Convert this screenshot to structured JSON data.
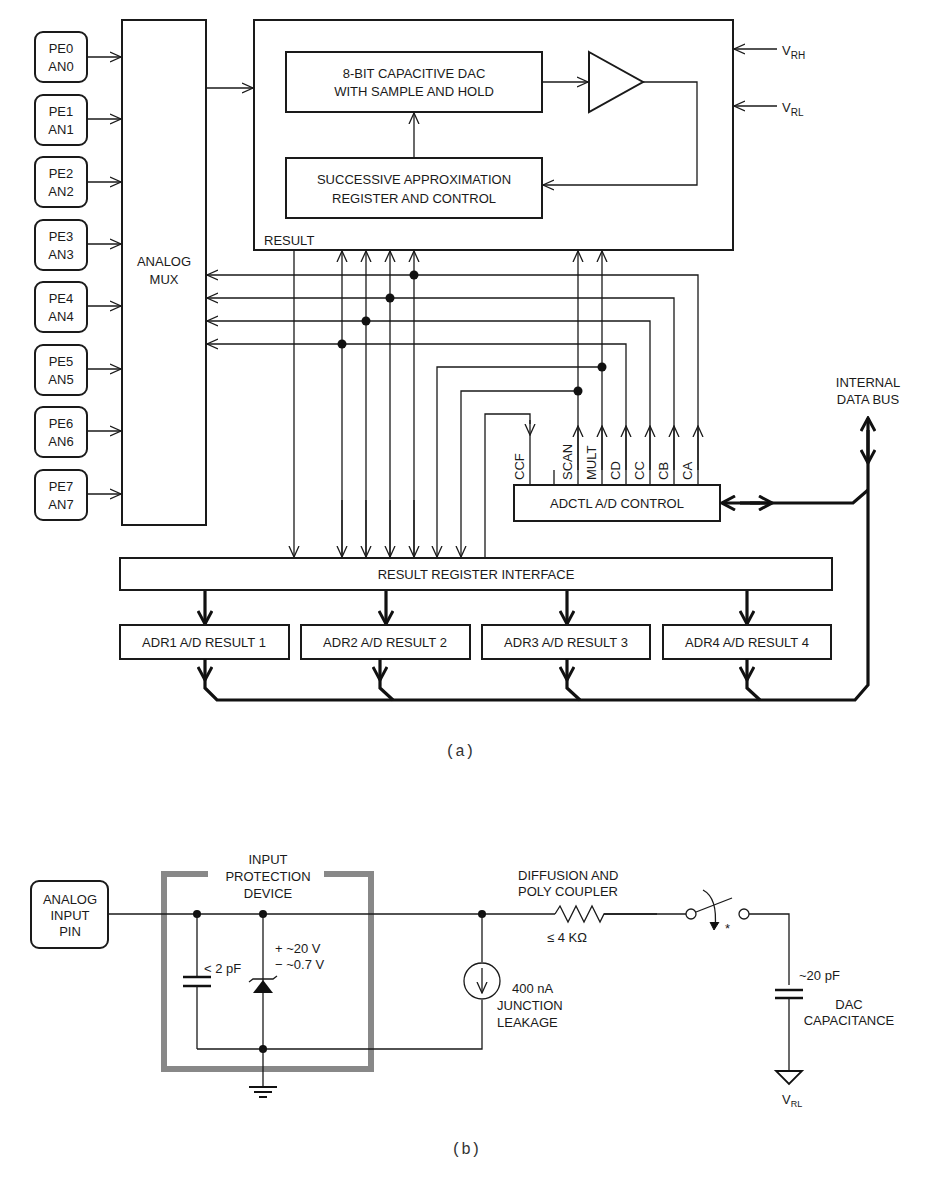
{
  "figure_a": {
    "label": "(a)",
    "pins": [
      {
        "port": "PE0",
        "analog": "AN0"
      },
      {
        "port": "PE1",
        "analog": "AN1"
      },
      {
        "port": "PE2",
        "analog": "AN2"
      },
      {
        "port": "PE3",
        "analog": "AN3"
      },
      {
        "port": "PE4",
        "analog": "AN4"
      },
      {
        "port": "PE5",
        "analog": "AN5"
      },
      {
        "port": "PE6",
        "analog": "AN6"
      },
      {
        "port": "PE7",
        "analog": "AN7"
      }
    ],
    "mux": {
      "line1": "ANALOG",
      "line2": "MUX"
    },
    "dac": {
      "line1": "8-BIT CAPACITIVE DAC",
      "line2": "WITH SAMPLE AND HOLD"
    },
    "sar": {
      "line1": "SUCCESSIVE APPROXIMATION",
      "line2": "REGISTER AND CONTROL"
    },
    "result_label": "RESULT",
    "vrh": {
      "main": "V",
      "sub": "RH"
    },
    "vrl": {
      "main": "V",
      "sub": "RL"
    },
    "control_bits": [
      "CCF",
      "SCAN",
      "MULT",
      "CD",
      "CC",
      "CB",
      "CA"
    ],
    "adctl": "ADCTL A/D CONTROL",
    "internal_bus": {
      "line1": "INTERNAL",
      "line2": "DATA BUS"
    },
    "result_interface": "RESULT REGISTER INTERFACE",
    "result_registers": [
      "ADR1 A/D RESULT 1",
      "ADR2 A/D RESULT 2",
      "ADR3 A/D RESULT 3",
      "ADR4 A/D RESULT 4"
    ]
  },
  "figure_b": {
    "label": "(b)",
    "input_pin": {
      "line1": "ANALOG",
      "line2": "INPUT",
      "line3": "PIN"
    },
    "protection": {
      "line1": "INPUT",
      "line2": "PROTECTION",
      "line3": "DEVICE"
    },
    "cap_in": "< 2 pF",
    "zener_pos": "+ ~20 V",
    "zener_neg": "− ~0.7 V",
    "leak_value": "400 nA",
    "leak_line2": "JUNCTION",
    "leak_line3": "LEAKAGE",
    "coupler_line1": "DIFFUSION AND",
    "coupler_line2": "POLY COUPLER",
    "coupler_value": "≤ 4 KΩ",
    "switch_mark": "*",
    "dac_cap_value": "~20 pF",
    "dac_cap_line1": "DAC",
    "dac_cap_line2": "CAPACITANCE",
    "vrl": {
      "main": "V",
      "sub": "RL"
    }
  }
}
